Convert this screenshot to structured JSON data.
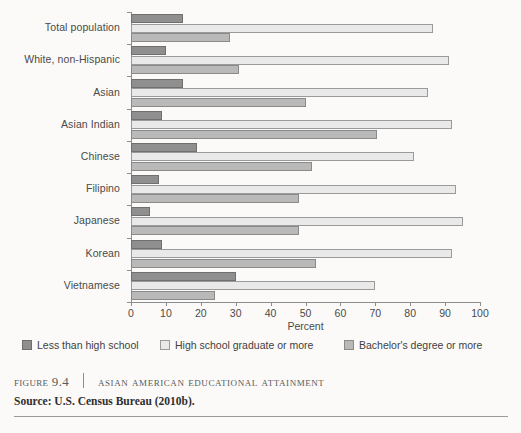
{
  "figure": {
    "number_label": "FIGURE 9.4",
    "title": "ASIAN AMERICAN EDUCATIONAL ATTAINMENT",
    "source": "Source: U.S. Census Bureau (2010b)."
  },
  "legend": {
    "items": [
      {
        "label": "Less than high school",
        "color": "#8f8f8f"
      },
      {
        "label": "High school graduate or more",
        "color": "#e9e9e9"
      },
      {
        "label": "Bachelor's degree or more",
        "color": "#b9b9b9"
      }
    ]
  },
  "chart_data": {
    "type": "bar",
    "orientation": "horizontal",
    "title": "Asian American Educational Attainment",
    "xlabel": "Percent",
    "ylabel": "",
    "xlim": [
      0,
      100
    ],
    "xticks": [
      0,
      10,
      20,
      30,
      40,
      50,
      60,
      70,
      80,
      90,
      100
    ],
    "xtick_labels": [
      "0",
      "10",
      "20",
      "30",
      "40",
      "50",
      "60",
      "70",
      "80",
      "90",
      "100"
    ],
    "grid": false,
    "legend_position": "below",
    "categories": [
      "Total population",
      "White, non-Hispanic",
      "Asian",
      "Asian Indian",
      "Chinese",
      "Filipino",
      "Japanese",
      "Korean",
      "Vietnamese"
    ],
    "series": [
      {
        "name": "Less than high school",
        "color": "#8f8f8f",
        "values": [
          15,
          10,
          15,
          9,
          19,
          8,
          5.5,
          9,
          30
        ]
      },
      {
        "name": "High school graduate or more",
        "color": "#e9e9e9",
        "values": [
          86.5,
          91,
          85,
          92,
          81,
          93,
          95,
          92,
          70
        ]
      },
      {
        "name": "Bachelor's degree or more",
        "color": "#b9b9b9",
        "values": [
          28.5,
          31,
          50,
          70.5,
          52,
          48,
          48,
          53,
          24
        ]
      }
    ]
  }
}
